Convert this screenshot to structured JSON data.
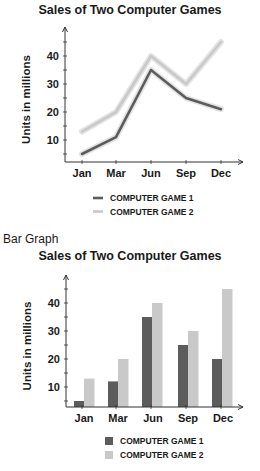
{
  "line_section": {
    "title": "Sales of Two Computer Games"
  },
  "bar_section": {
    "label": "Bar Graph",
    "title": "Sales of Two Computer Games"
  },
  "colors": {
    "game1": "#5c5c5c",
    "game2": "#c9c9c9",
    "axis": "#333333"
  },
  "chart_data": [
    {
      "type": "line",
      "title": "Sales of Two Computer Games",
      "xlabel": "",
      "ylabel": "Units in millions",
      "categories": [
        "Jan",
        "Mar",
        "Jun",
        "Sep",
        "Dec"
      ],
      "series": [
        {
          "name": "COMPUTER GAME 1",
          "values": [
            5,
            11,
            35,
            25,
            21
          ]
        },
        {
          "name": "COMPUTER GAME 2",
          "values": [
            13,
            20,
            40,
            30,
            45
          ]
        }
      ],
      "yticks": [
        10,
        20,
        30,
        40
      ],
      "ylim": [
        0,
        48
      ],
      "grid": false,
      "legend_position": "bottom"
    },
    {
      "type": "bar",
      "title": "Sales of Two Computer Games",
      "xlabel": "",
      "ylabel": "Units in millions",
      "categories": [
        "Jan",
        "Mar",
        "Jun",
        "Sep",
        "Dec"
      ],
      "series": [
        {
          "name": "COMPUTER GAME 1",
          "values": [
            5,
            12,
            35,
            25,
            20
          ]
        },
        {
          "name": "COMPUTER GAME 2",
          "values": [
            13,
            20,
            40,
            30,
            45
          ]
        }
      ],
      "yticks": [
        10,
        20,
        30,
        40
      ],
      "ylim": [
        0,
        48
      ],
      "grid": false,
      "legend_position": "bottom"
    }
  ]
}
